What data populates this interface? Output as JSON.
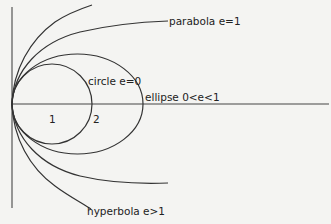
{
  "figure": {
    "colors": {
      "background": "#f4f4f2",
      "stroke": "#333333",
      "text": "#222222"
    },
    "labels": {
      "parabola": "parabola e=1",
      "circle": "circle e=0",
      "ellipse": "ellipse 0<e<1",
      "hyperbola": "hyperbola e>1",
      "mark_1": "1",
      "mark_2": "2"
    },
    "curves": [
      {
        "name": "circle",
        "eccentricity": "0"
      },
      {
        "name": "ellipse",
        "eccentricity": "0<e<1"
      },
      {
        "name": "parabola",
        "eccentricity": "1"
      },
      {
        "name": "hyperbola",
        "eccentricity": ">1"
      }
    ]
  }
}
